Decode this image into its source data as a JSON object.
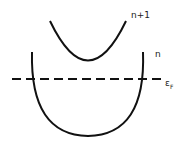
{
  "diagram": {
    "type": "band-structure",
    "bands": [
      {
        "label": "n+1"
      },
      {
        "label": "n"
      }
    ],
    "fermi_level": {
      "label": "εF",
      "symbol": "ε",
      "subscript": "F",
      "style": "dashed"
    },
    "colors": {
      "stroke": "#111111",
      "background": "#ffffff"
    }
  }
}
